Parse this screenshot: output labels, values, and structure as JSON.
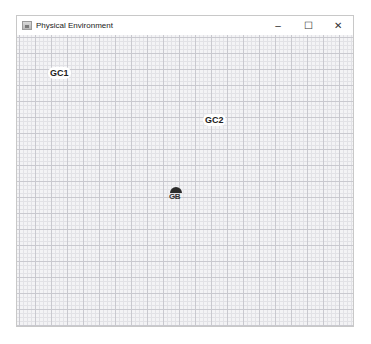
{
  "window": {
    "title": "Physical Environment",
    "icon": "java-app-icon",
    "controls": {
      "minimize": "–",
      "maximize": "☐",
      "close": "✕"
    }
  },
  "canvas": {
    "grid": "graph-paper",
    "nodes": [
      {
        "label": "GC1",
        "x": 62,
        "y": 75
      },
      {
        "label": "GC2",
        "x": 218,
        "y": 121
      },
      {
        "label": "GB",
        "x": 175,
        "y": 193,
        "icon": "umbrella-icon"
      }
    ]
  }
}
